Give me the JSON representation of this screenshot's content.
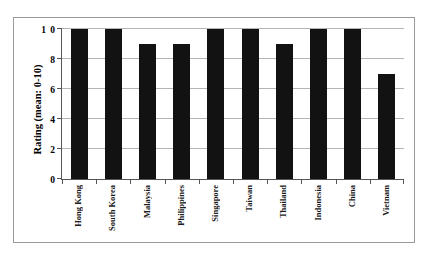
{
  "scan": {
    "header_remnant": "",
    "page_number": ""
  },
  "chart_data": {
    "type": "bar",
    "title": "",
    "xlabel": "",
    "ylabel": "Rating (mean: 0-10)",
    "ylim": [
      0,
      10
    ],
    "yticks": [
      0,
      2,
      4,
      6,
      8,
      10
    ],
    "ytick_labels": [
      "0",
      "2",
      "4",
      "6",
      "8",
      "1 0"
    ],
    "grid": true,
    "legend": null,
    "bar_color": "#121212",
    "categories": [
      "Hong Kong",
      "South Korea",
      "Malaysia",
      "Philippines",
      "Singapore",
      "Taiwan",
      "Thailand",
      "Indonesia",
      "China",
      "Vietnam"
    ],
    "values": [
      10,
      10,
      9,
      9,
      10,
      10,
      9,
      10,
      10,
      7
    ]
  }
}
